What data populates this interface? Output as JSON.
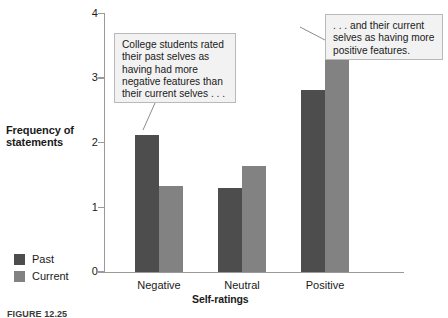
{
  "chart_data": {
    "type": "bar",
    "title": "",
    "xlabel": "Self-ratings",
    "ylabel": "Frequency of statements",
    "ylim": [
      0,
      4
    ],
    "yticks": [
      "0",
      "1",
      "2",
      "3",
      "4"
    ],
    "grid": false,
    "legend_position": "left-bottom",
    "categories": [
      "Negative",
      "Neutral",
      "Positive"
    ],
    "series": [
      {
        "name": "Past",
        "values": [
          2.12,
          1.3,
          2.81
        ],
        "color": "#4d4d4d"
      },
      {
        "name": "Current",
        "values": [
          1.33,
          1.64,
          3.88
        ],
        "color": "#828282"
      }
    ],
    "annotations": [
      "College students rated their past selves as having had more negative features than their current selves . . .",
      ". . . and their current selves as having more positive features."
    ]
  },
  "axis": {
    "y_title_line1": "Frequency of",
    "y_title_line2": "statements",
    "x_title": "Self-ratings",
    "y_tick_0": "0",
    "y_tick_1": "1",
    "y_tick_2": "2",
    "y_tick_3": "3",
    "y_tick_4": "4"
  },
  "categories": {
    "negative": "Negative",
    "neutral": "Neutral",
    "positive": "Positive"
  },
  "legend": {
    "past": "Past",
    "current": "Current"
  },
  "callouts": {
    "left": "College students rated their past selves as having had more negative features than their current selves . . .",
    "right": ". . . and their current selves as having more positive features."
  },
  "caption": {
    "label": "FIGURE 12.25"
  }
}
